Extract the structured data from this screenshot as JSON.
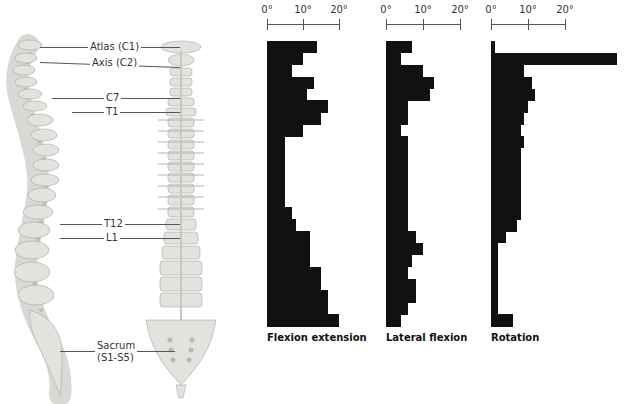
{
  "figure": {
    "spine_labels": [
      {
        "text": "Atlas (C1)"
      },
      {
        "text": "Axis (C2)"
      },
      {
        "text": "C7"
      },
      {
        "text": "T1"
      },
      {
        "text": "T12"
      },
      {
        "text": "L1"
      },
      {
        "text": "Sacrum"
      },
      {
        "text": "(S1-S5)"
      }
    ]
  },
  "chart_data": [
    {
      "type": "bar",
      "orientation": "horizontal",
      "title": "Flexion extension",
      "xlabel": "",
      "ylabel": "",
      "x_ticks": [
        "0°",
        "10°",
        "20°"
      ],
      "xlim": [
        0,
        20
      ],
      "categories": [
        "C1-C2",
        "C2-C3",
        "C3-C4",
        "C4-C5",
        "C5-C6",
        "C6-C7",
        "C7-T1",
        "T1-T2",
        "T2-T3",
        "T3-T4",
        "T4-T5",
        "T5-T6",
        "T6-T7",
        "T7-T8",
        "T8-T9",
        "T9-T10",
        "T10-T11",
        "T11-T12",
        "T12-L1",
        "L1-L2",
        "L2-L3",
        "L3-L4",
        "L4-L5",
        "L5-S1"
      ],
      "values": [
        14,
        10,
        7,
        13,
        11,
        17,
        15,
        10,
        5,
        5,
        5,
        5,
        5,
        5,
        7,
        8,
        12,
        12,
        12,
        15,
        15,
        17,
        17,
        20
      ]
    },
    {
      "type": "bar",
      "orientation": "horizontal",
      "title": "Lateral flexion",
      "xlabel": "",
      "ylabel": "",
      "x_ticks": [
        "0°",
        "10°",
        "20°"
      ],
      "xlim": [
        0,
        20
      ],
      "categories": [
        "C1-C2",
        "C2-C3",
        "C3-C4",
        "C4-C5",
        "C5-C6",
        "C6-C7",
        "C7-T1",
        "T1-T2",
        "T2-T3",
        "T3-T4",
        "T4-T5",
        "T5-T6",
        "T6-T7",
        "T7-T8",
        "T8-T9",
        "T9-T10",
        "T10-T11",
        "T11-T12",
        "T12-L1",
        "L1-L2",
        "L2-L3",
        "L3-L4",
        "L4-L5",
        "L5-S1"
      ],
      "values": [
        7,
        4,
        10,
        13,
        12,
        6,
        6,
        4,
        6,
        6,
        6,
        6,
        6,
        6,
        6,
        6,
        8,
        10,
        7,
        6,
        8,
        8,
        6,
        4
      ]
    },
    {
      "type": "bar",
      "orientation": "horizontal",
      "title": "Rotation",
      "xlabel": "",
      "ylabel": "",
      "x_ticks": [
        "0°",
        "10°",
        "20°"
      ],
      "xlim": [
        0,
        20
      ],
      "categories": [
        "C1-C2",
        "C2-C3",
        "C3-C4",
        "C4-C5",
        "C5-C6",
        "C6-C7",
        "C7-T1",
        "T1-T2",
        "T2-T3",
        "T3-T4",
        "T4-T5",
        "T5-T6",
        "T6-T7",
        "T7-T8",
        "T8-T9",
        "T9-T10",
        "T10-T11",
        "T11-T12",
        "T12-L1",
        "L1-L2",
        "L2-L3",
        "L3-L4",
        "L4-L5",
        "L5-S1"
      ],
      "values": [
        1,
        34,
        9,
        11,
        12,
        10,
        9,
        8,
        9,
        8,
        8,
        8,
        8,
        8,
        8,
        7,
        4,
        2,
        2,
        2,
        2,
        2,
        2,
        6
      ]
    }
  ]
}
